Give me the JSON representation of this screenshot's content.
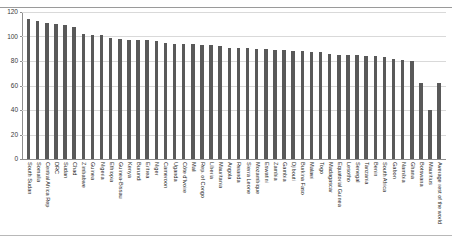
{
  "chart_data": {
    "type": "bar",
    "title": "",
    "subtitle": "",
    "xlabel": "",
    "ylabel": "",
    "ylim": [
      0,
      120
    ],
    "ytick_values": [
      0,
      20,
      40,
      60,
      80,
      100,
      120
    ],
    "ytick_labels": [
      "0",
      "20",
      "40",
      "60",
      "80",
      "100",
      "120"
    ],
    "grid": true,
    "legend": "none",
    "bar_color": "#595959",
    "gridline_color": "#d9d9d9",
    "axis_color": "#8e8e8e",
    "categories": [
      "South Sudan",
      "Somalia",
      "Central Africa Rep",
      "DRC",
      "Sudan",
      "Chad",
      "Zimbabwe",
      "Guinea",
      "Nigeria",
      "Ethiopia",
      "Guinea-Bissau",
      "Kenya",
      "Burundi",
      "Eritrea",
      "Niger",
      "Cameroon",
      "Uganda",
      "Côte d'Ivoire",
      "Mali",
      "Rep. of Congo",
      "Liberia",
      "Mauritania",
      "Angola",
      "Rwanda",
      "Sierra Leone",
      "Mozambique",
      "Eswatini",
      "Zambia",
      "Gambia",
      "Djibouti",
      "Burkina Faso",
      "Malawi",
      "Togo",
      "Madagascar",
      "Equatorial Guinea",
      "Lesotho",
      "Senegal",
      "Tanzania",
      "Benin",
      "South Africa",
      "Gabon",
      "Namibia",
      "Ghana",
      "Botswana",
      "Mauritius",
      "Average rest of the world"
    ],
    "values": [
      114,
      113,
      111,
      110,
      109,
      108,
      102,
      101,
      101,
      99,
      98,
      97,
      97,
      97,
      96,
      95,
      94,
      94,
      94,
      93,
      93,
      92,
      91,
      91,
      91,
      90,
      90,
      89,
      89,
      88,
      88,
      87,
      87,
      86,
      85,
      85,
      85,
      84,
      84,
      83,
      82,
      81,
      80,
      62,
      40,
      62
    ]
  },
  "figure": {
    "ghost_title": ""
  }
}
